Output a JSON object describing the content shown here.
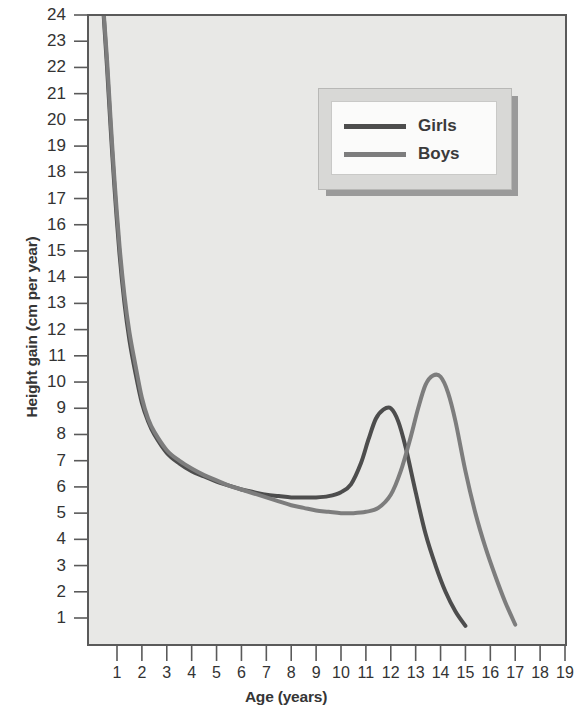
{
  "chart_data": {
    "type": "line",
    "title": "",
    "xlabel": "Age (years)",
    "ylabel": "Height gain (cm per year)",
    "xlim": [
      0,
      19.2
    ],
    "ylim": [
      0,
      24.4
    ],
    "grid": false,
    "legend_position": "top-right",
    "x_ticks": [
      "1",
      "2",
      "3",
      "4",
      "5",
      "6",
      "7",
      "8",
      "9",
      "10",
      "11",
      "12",
      "13",
      "14",
      "15",
      "16",
      "17",
      "18",
      "19"
    ],
    "y_ticks": [
      "1",
      "2",
      "3",
      "4",
      "5",
      "6",
      "7",
      "8",
      "9",
      "10",
      "11",
      "12",
      "13",
      "14",
      "15",
      "16",
      "17",
      "18",
      "19",
      "20",
      "21",
      "22",
      "23",
      "24"
    ],
    "series": [
      {
        "name": "Girls",
        "color": "#4d4d4d",
        "x": [
          0.45,
          0.6,
          0.75,
          0.9,
          1.1,
          1.3,
          1.5,
          1.75,
          2.0,
          2.25,
          2.5,
          3.0,
          3.5,
          4.0,
          4.5,
          5.0,
          5.5,
          6.0,
          6.5,
          7.0,
          7.5,
          8.0,
          8.5,
          9.0,
          9.5,
          10.0,
          10.4,
          10.8,
          11.1,
          11.4,
          11.7,
          12.0,
          12.3,
          12.6,
          13.0,
          13.4,
          13.8,
          14.2,
          14.6,
          15.0
        ],
        "y": [
          24.2,
          22.0,
          19.6,
          17.4,
          14.9,
          13.0,
          11.6,
          10.3,
          9.2,
          8.5,
          8.0,
          7.3,
          6.9,
          6.6,
          6.4,
          6.2,
          6.05,
          5.9,
          5.8,
          5.7,
          5.65,
          5.6,
          5.6,
          5.6,
          5.65,
          5.8,
          6.1,
          6.9,
          7.8,
          8.6,
          8.95,
          9.0,
          8.5,
          7.5,
          5.8,
          4.2,
          3.0,
          2.0,
          1.25,
          0.7
        ]
      },
      {
        "name": "Boys",
        "color": "#7d7d7d",
        "x": [
          0.45,
          0.6,
          0.75,
          0.9,
          1.1,
          1.3,
          1.5,
          1.75,
          2.0,
          2.25,
          2.5,
          3.0,
          3.5,
          4.0,
          4.5,
          5.0,
          5.5,
          6.0,
          6.5,
          7.0,
          7.5,
          8.0,
          8.5,
          9.0,
          9.5,
          10.0,
          10.5,
          11.0,
          11.5,
          12.0,
          12.4,
          12.8,
          13.1,
          13.4,
          13.7,
          14.0,
          14.3,
          14.6,
          15.0,
          15.4,
          15.8,
          16.2,
          16.6,
          17.0
        ],
        "y": [
          24.3,
          22.3,
          19.9,
          17.7,
          15.2,
          13.3,
          11.9,
          10.6,
          9.4,
          8.6,
          8.1,
          7.4,
          7.0,
          6.7,
          6.45,
          6.25,
          6.05,
          5.9,
          5.75,
          5.6,
          5.45,
          5.3,
          5.2,
          5.1,
          5.05,
          5.0,
          5.0,
          5.05,
          5.2,
          5.7,
          6.6,
          7.9,
          9.0,
          9.9,
          10.25,
          10.2,
          9.6,
          8.5,
          6.6,
          5.0,
          3.7,
          2.6,
          1.6,
          0.75
        ]
      }
    ],
    "annotations": []
  },
  "legend": {
    "items": [
      {
        "label": "Girls",
        "color": "#4d4d4d"
      },
      {
        "label": "Boys",
        "color": "#7d7d7d"
      }
    ]
  },
  "colors": {
    "plot_background": "#e8e8e6",
    "page_background": "#ffffff",
    "axis": "#5a5a5a",
    "tick_text": "#333333",
    "axis_title": "#353535",
    "legend_frame": "#d8d8d6",
    "legend_fill": "#fbfbfa",
    "legend_shadow": "#9a9a9a"
  }
}
